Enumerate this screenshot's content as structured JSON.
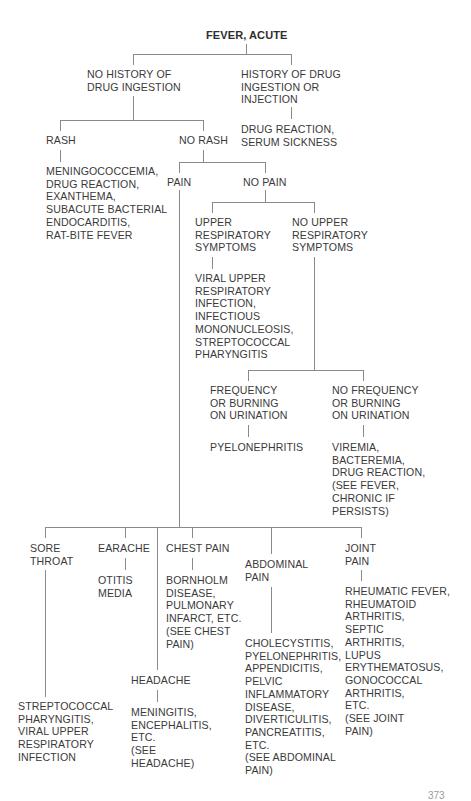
{
  "diagram": {
    "title": "FEVER, ACUTE",
    "nodes": {
      "no_drug_history": "NO HISTORY OF\nDRUG INGESTION",
      "drug_history": "HISTORY OF DRUG\nINGESTION OR\nINJECTION",
      "drug_reaction": "DRUG REACTION,\nSERUM SICKNESS",
      "rash": "RASH",
      "no_rash": "NO RASH",
      "rash_dx": "MENINGOCOCCEMIA,\nDRUG REACTION,\nEXANTHEMA,\nSUBACUTE BACTERIAL\nENDOCARDITIS,\nRAT-BITE FEVER",
      "pain": "PAIN",
      "no_pain": "NO PAIN",
      "upper_resp": "UPPER\nRESPIRATORY\nSYMPTOMS",
      "no_upper_resp": "NO UPPER\nRESPIRATORY\nSYMPTOMS",
      "upper_resp_dx": "VIRAL UPPER\nRESPIRATORY\nINFECTION,\nINFECTIOUS\nMONONUCLEOSIS,\nSTREPTOCOCCAL\nPHARYNGITIS",
      "frequency": "FREQUENCY\nOR BURNING\nON URINATION",
      "no_frequency": "NO FREQUENCY\nOR BURNING\nON URINATION",
      "frequency_dx": "PYELONEPHRITIS",
      "no_frequency_dx": "VIREMIA,\nBACTEREMIA,\nDRUG REACTION,\n(SEE FEVER,\nCHRONIC IF\nPERSISTS)",
      "sore_throat": "SORE\nTHROAT",
      "sore_throat_dx": "STREPTOCOCCAL\nPHARYNGITIS,\nVIRAL UPPER\nRESPIRATORY\nINFECTION",
      "earache": "EARACHE",
      "earache_dx": "OTITIS\nMEDIA",
      "chest_pain": "CHEST PAIN",
      "chest_pain_dx": "BORNHOLM\nDISEASE,\nPULMONARY\nINFARCT, ETC.\n(SEE CHEST\nPAIN)",
      "headache": "HEADACHE",
      "headache_dx": "MENINGITIS,\nENCEPHALITIS,\nETC.\n(SEE\nHEADACHE)",
      "abdominal_pain": "ABDOMINAL\nPAIN",
      "abdominal_pain_dx": "CHOLECYSTITIS,\nPYELONEPHRITIS,\nAPPENDICITIS,\nPELVIC\nINFLAMMATORY\nDISEASE,\nDIVERTICULITIS,\nPANCREATITIS,\nETC.\n(SEE ABDOMINAL\nPAIN)",
      "joint_pain": "JOINT\nPAIN",
      "joint_pain_dx": "RHEUMATIC FEVER,\nRHEUMATOID\nARTHRITIS,\nSEPTIC\nARTHRITIS,\nLUPUS\nERYTHEMATOSUS,\nGONOCOCCAL\nARTHRITIS,\nETC.\n(SEE JOINT\nPAIN)"
    },
    "page_number": "373",
    "colors": {
      "line": "#8a8a8a",
      "text": "#3a3a3a",
      "background": "#ffffff"
    }
  }
}
